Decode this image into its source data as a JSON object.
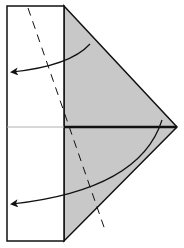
{
  "diagram": {
    "type": "origami-fold-step",
    "colors": {
      "paper_front": "#ffffff",
      "paper_back": "#c8c8c8",
      "line": "#111111",
      "guide": "#b0b0b0"
    },
    "elements": [
      {
        "name": "white-rectangle-flap",
        "shape": "rect",
        "x": 7,
        "y": 6,
        "w": 57,
        "h": 235
      },
      {
        "name": "gray-triangle-flap",
        "shape": "polygon",
        "points": "64,6 177,127 64,241"
      },
      {
        "name": "center-crease-thin",
        "shape": "line",
        "x1": 7,
        "y1": 127,
        "x2": 64,
        "y2": 127
      },
      {
        "name": "center-edge-thick",
        "shape": "line",
        "x1": 64,
        "y1": 127,
        "x2": 177,
        "y2": 127
      },
      {
        "name": "valley-fold-dashed-line",
        "shape": "line",
        "x1": 28,
        "y1": 8,
        "x2": 105,
        "y2": 230
      },
      {
        "name": "fold-arrow-upper",
        "from": [
          90,
          44
        ],
        "to": [
          10,
          72
        ]
      },
      {
        "name": "fold-arrow-lower",
        "from": [
          162,
          120
        ],
        "to": [
          10,
          204
        ]
      }
    ]
  }
}
